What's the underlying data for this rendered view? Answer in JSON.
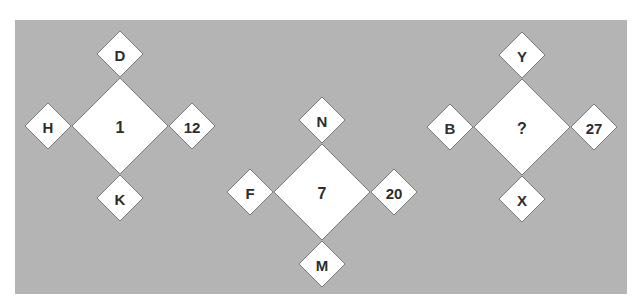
{
  "puzzle": {
    "groups": [
      {
        "center": "1",
        "top": "D",
        "left": "H",
        "right": "12",
        "bottom": "K"
      },
      {
        "center": "7",
        "top": "N",
        "left": "F",
        "right": "20",
        "bottom": "M"
      },
      {
        "center": "?",
        "top": "Y",
        "left": "B",
        "right": "27",
        "bottom": "X"
      }
    ]
  }
}
